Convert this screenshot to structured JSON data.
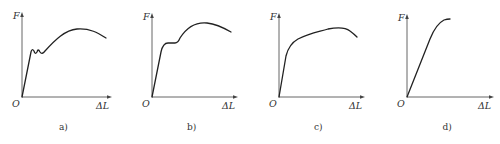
{
  "figure": {
    "panels": [
      {
        "id": "a",
        "caption": "a)",
        "y_label": "F",
        "x_label": "ΔL",
        "origin_label": "O",
        "curve_type": "discontinuous-yield",
        "origin": [
          22,
          97
        ],
        "axis_top": 12,
        "axis_right": 112,
        "path": "M22,97 L31,52 Q32,48 34,51 Q35,55 37,52 Q38,48 40,52 Q42,55 45,51 C55,40 65,30 77,29 C90,28 98,33 106,38"
      },
      {
        "id": "b",
        "caption": "b)",
        "y_label": "F",
        "x_label": "ΔL",
        "origin_label": "O",
        "curve_type": "plateau-yield",
        "origin": [
          152,
          97
        ],
        "axis_top": 13,
        "axis_right": 238,
        "path": "M152,97 L161,52 Q163,43 168,43 L175,43 Q178,43 180,38 C187,27 197,22 207,23 C216,24 224,28 231,32"
      },
      {
        "id": "c",
        "caption": "c)",
        "y_label": "F",
        "x_label": "ΔL",
        "origin_label": "O",
        "curve_type": "continuous-yield",
        "origin": [
          279,
          97
        ],
        "axis_top": 13,
        "axis_right": 365,
        "path": "M279,97 L286,56 Q289,44 298,39 C310,33 318,32 328,29 C338,27 345,27 350,31 Q354,34 357,37"
      },
      {
        "id": "d",
        "caption": "d)",
        "y_label": "F",
        "x_label": "ΔL",
        "origin_label": "O",
        "curve_type": "brittle",
        "origin": [
          407,
          97
        ],
        "axis_top": 14,
        "axis_right": 494,
        "path": "M407,97 L430,39 Q436,24 444,20 Q447,19 450,19"
      }
    ]
  }
}
